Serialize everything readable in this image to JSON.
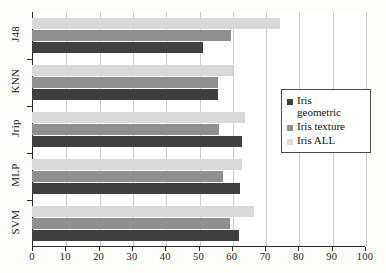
{
  "chart_data": {
    "type": "bar",
    "orientation": "horizontal",
    "title": "",
    "subtitle": "",
    "xlabel": "",
    "ylabel": "",
    "xlim": [
      0,
      100
    ],
    "ylim": null,
    "grid": true,
    "legend_position": "right-center",
    "categories": [
      "J48",
      "KNN",
      "Jrip",
      "MLP",
      "SVM"
    ],
    "xticks": [
      0,
      10,
      20,
      30,
      40,
      50,
      60,
      70,
      80,
      90,
      100
    ],
    "xticklabels": [
      "0",
      "10",
      "20",
      "30",
      "40",
      "50",
      "60",
      "70",
      "80",
      "90",
      "100"
    ],
    "series": [
      {
        "name": "Iris geometric",
        "color": "#3f3f3f",
        "values": [
          51.3,
          55.8,
          63.0,
          62.5,
          62.3
        ]
      },
      {
        "name": "Iris texture",
        "color": "#8f8f8f",
        "values": [
          59.7,
          55.8,
          56.3,
          57.5,
          59.6
        ]
      },
      {
        "name": "Iris ALL",
        "color": "#d9d9d9",
        "values": [
          74.4,
          60.3,
          64.1,
          63.2,
          66.8
        ]
      }
    ]
  },
  "legend": {
    "entries": [
      {
        "label": "Iris\ngeometric",
        "swatch": "dark-gray-swatch"
      },
      {
        "label": "Iris texture",
        "swatch": "medium-gray-swatch"
      },
      {
        "label": "Iris ALL",
        "swatch": "light-gray-swatch"
      }
    ]
  },
  "colors": {
    "series_dark": "#3f3f3f",
    "series_medium": "#8f8f8f",
    "series_light": "#d9d9d9",
    "axis": "#2b2b2b",
    "grid": "#cfcfcf",
    "background": "#fdfdfc"
  }
}
